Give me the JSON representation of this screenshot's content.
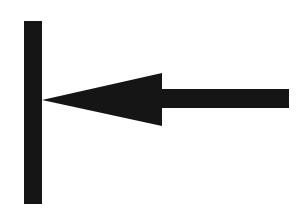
{
  "figure": {
    "name": "arrow-pointing-left-at-vertical-bar",
    "canvas": {
      "width": 301,
      "height": 220,
      "background_color": "#ffffff"
    },
    "ink_color": "#151515",
    "shapes": {
      "vertical_bar": {
        "label": "vertical-bar",
        "x": 24,
        "y": 21,
        "width": 18,
        "height": 183,
        "color": "#151515"
      },
      "arrow_head": {
        "label": "arrow-head",
        "direction": "left",
        "tip_x": 42,
        "tip_y": 100,
        "base_x": 162,
        "base_top_y": 73,
        "base_bottom_y": 126,
        "points": "42,100 162,73 162,126",
        "color": "#151515"
      },
      "arrow_shaft": {
        "label": "arrow-shaft",
        "x": 161,
        "y": 89,
        "width": 128,
        "height": 19,
        "color": "#151515"
      }
    }
  }
}
